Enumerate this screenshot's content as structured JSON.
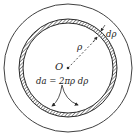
{
  "diagram": {
    "labels": {
      "center": "O",
      "radius": "ρ",
      "thickness": "dρ",
      "area_formula": "da = 2πρ dρ"
    },
    "colors": {
      "stroke": "#2a2a2a",
      "background": "#ffffff"
    }
  }
}
